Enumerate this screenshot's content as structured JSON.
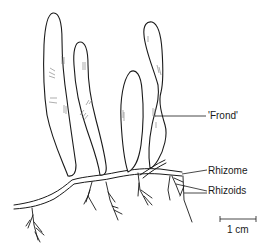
{
  "figure": {
    "labels": {
      "frond": "'Frond'",
      "rhizome": "Rhizome",
      "rhizoids": "Rhizoids"
    },
    "scale_bar": {
      "label": "1 cm"
    },
    "colors": {
      "ink": "#1a1a1a",
      "background": "#ffffff",
      "shading": "#777777"
    }
  }
}
